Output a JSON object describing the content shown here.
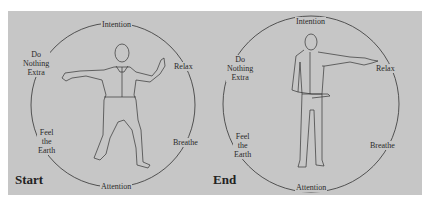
{
  "panels": [
    {
      "caption": "Start",
      "labels": {
        "top": "Intention",
        "upper_left_1": "Do",
        "upper_left_2": "Nothing",
        "upper_left_3": "Extra",
        "upper_right": "Relax",
        "lower_left_1": "Feel",
        "lower_left_2": "the",
        "lower_left_3": "Earth",
        "lower_right": "Breathe",
        "bottom": "Attention"
      }
    },
    {
      "caption": "End",
      "labels": {
        "top": "Intention",
        "upper_left_1": "Do",
        "upper_left_2": "Nothing",
        "upper_left_3": "Extra",
        "upper_right": "Relax",
        "lower_left_1": "Feel",
        "lower_left_2": "the",
        "lower_left_3": "Earth",
        "lower_right": "Breathe",
        "bottom": "Attention"
      }
    }
  ],
  "colors": {
    "background": "#c6c6c6",
    "ink": "#2a2a2a"
  }
}
